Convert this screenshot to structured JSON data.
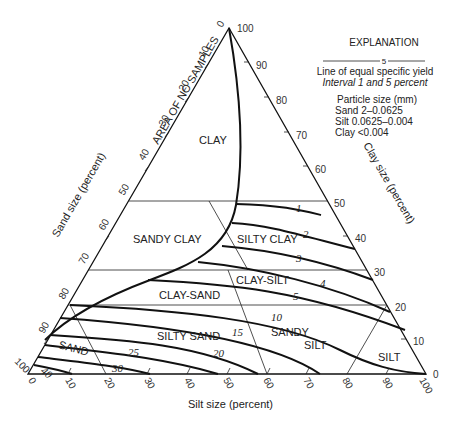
{
  "explanation": {
    "title": "EXPLANATION",
    "sample_label": "5",
    "line_desc": "Line of equal specific yield",
    "interval": "Interval 1 and 5 percent",
    "particle_title": "Particle size (mm)",
    "sand": "Sand 2–0.0625",
    "silt": "Silt 0.0625–0.004",
    "clay": "Clay <0.004"
  },
  "axes": {
    "sand_label": "Sand size (percent)",
    "clay_label": "Clay size (percent)",
    "silt_label": "Silt size (percent)",
    "apex_label": "100",
    "sand_ticks": [
      "0",
      "10",
      "20",
      "30",
      "40",
      "50",
      "60",
      "70",
      "80",
      "90",
      "100"
    ],
    "clay_ticks": [
      "90",
      "80",
      "70",
      "60",
      "50",
      "40",
      "30",
      "20",
      "10",
      "0"
    ],
    "silt_ticks": [
      "0",
      "10",
      "20",
      "30",
      "40",
      "50",
      "60",
      "70",
      "80",
      "90",
      "100"
    ]
  },
  "regions": {
    "no_samples": "AREA OF NO SAMPLES",
    "clay": "CLAY",
    "sandy_clay": "SANDY CLAY",
    "silty_clay": "SILTY CLAY",
    "clay_silt": "CLAY-SILT",
    "clay_sand": "CLAY-SAND",
    "silty_sand": "SILTY SAND",
    "sandy_silt_1": "SANDY",
    "sandy_silt_2": "SILT",
    "sand": "SAND",
    "silt": "SILT"
  },
  "contours": {
    "c1": "1",
    "c2": "2",
    "c3": "3",
    "c4": "4",
    "c5": "5",
    "c10": "10",
    "c15": "15",
    "c20": "20",
    "c25": "25",
    "c30": "30",
    "c40": "40"
  }
}
